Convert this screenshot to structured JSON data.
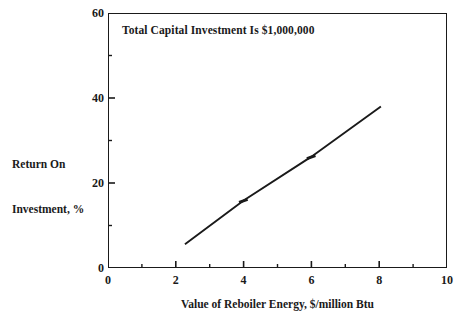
{
  "chart_data": {
    "type": "line",
    "title": "",
    "annotation": "Total Capital Investment Is $1,000,000",
    "xlabel": "Value of Reboiler Energy, $/million Btu",
    "ylabel_line1": "Return On",
    "ylabel_line2": "Investment, %",
    "ylabel": "Return On Investment, %",
    "xlim": [
      0,
      10
    ],
    "ylim": [
      0,
      60
    ],
    "xticks": [
      0,
      2,
      4,
      6,
      8,
      10
    ],
    "xtick_labels": [
      "0",
      "2",
      "4",
      "6",
      "8",
      "10"
    ],
    "xminor_ticks": [
      1,
      3,
      5,
      7,
      9
    ],
    "yticks": [
      0,
      20,
      40,
      60
    ],
    "ytick_labels": [
      "0",
      "20",
      "40",
      "60"
    ],
    "yminor_ticks": [
      10,
      30,
      50
    ],
    "grid": false,
    "legend": false,
    "series": [
      {
        "name": "Return on investment",
        "color": "#1a1a1a",
        "x": [
          2.27,
          4.0,
          6.0,
          8.05
        ],
        "y": [
          5.6,
          15.9,
          26.2,
          38.0
        ],
        "markers_at": [
          {
            "x": 4.0,
            "y": 15.9
          },
          {
            "x": 6.0,
            "y": 26.2
          }
        ]
      }
    ]
  },
  "figure": {
    "background_color": "#ffffff",
    "line_color": "#1a1a1a",
    "axis_color": "#1a1a1a"
  }
}
